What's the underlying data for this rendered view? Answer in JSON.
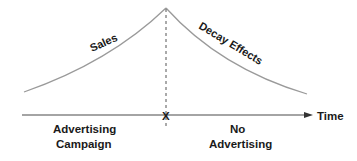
{
  "diagram": {
    "curves": {
      "rising": {
        "label": "Sales",
        "color": "#9a9a9a"
      },
      "falling": {
        "label": "Decay Effects",
        "color": "#9a9a9a"
      }
    },
    "axis": {
      "label": "Time",
      "marker": "X",
      "color": "#4a4a4a"
    },
    "regions": {
      "left": {
        "line1": "Advertising",
        "line2": "Campaign"
      },
      "right": {
        "line1": "No",
        "line2": "Advertising"
      }
    }
  }
}
